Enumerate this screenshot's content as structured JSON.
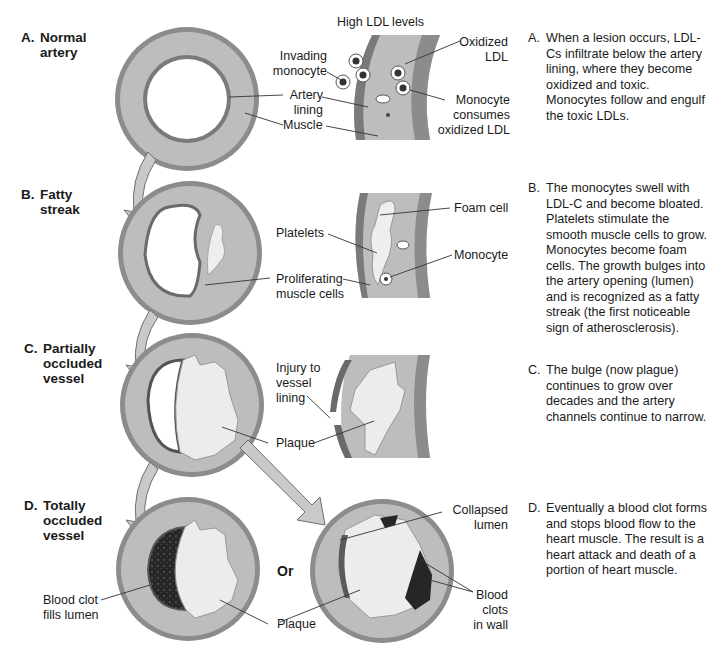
{
  "figure": {
    "colors": {
      "outer_wall": "#8c8c8c",
      "muscle": "#bdbdbd",
      "lining": "#7a7a7a",
      "lumen": "#ffffff",
      "plaque": "#ececec",
      "clot": "#2a2a2a",
      "arrow_fill": "#c9c9c9",
      "arrow_stroke": "#6f6f6f",
      "text": "#1a1a1a"
    }
  },
  "stages": [
    {
      "letter": "A.",
      "name": "Normal\nartery",
      "detail_header": "High LDL levels",
      "callouts": [
        "Invading\nmonocyte",
        "Artery\nlining",
        "Muscle",
        "Oxidized\nLDL",
        "Monocyte\nconsumes\noxidized LDL"
      ],
      "description": "When a lesion occurs, LDL-Cs infiltrate below the artery lining, where they become oxidized and toxic. Monocytes follow and engulf the toxic LDLs."
    },
    {
      "letter": "B.",
      "name": "Fatty\nstreak",
      "callouts": [
        "Platelets",
        "Proliferating\nmuscle cells",
        "Foam cell",
        "Monocyte"
      ],
      "description": "The monocytes swell with LDL-C and become bloated. Platelets stimulate the smooth muscle cells to grow. Monocytes become foam cells. The growth bulges into the artery opening (lumen) and is recognized as a fatty streak (the first noticeable sign of atherosclerosis)."
    },
    {
      "letter": "C.",
      "name": "Partially\noccluded\nvessel",
      "callouts": [
        "Injury to\nvessel\nlining",
        "Plaque"
      ],
      "description": "The bulge (now plague) continues to grow over decades and the artery channels continue to narrow."
    },
    {
      "letter": "D.",
      "name": "Totally\noccluded\nvessel",
      "callouts": [
        "Blood clot\nfills lumen",
        "Plaque",
        "Plaque",
        "Collapsed\nlumen",
        "Blood\nclots\nin wall"
      ],
      "or_label": "Or",
      "description": "Eventually a blood clot forms and stops blood flow to the heart muscle. The result is a heart attack and death of a portion of heart muscle."
    }
  ]
}
